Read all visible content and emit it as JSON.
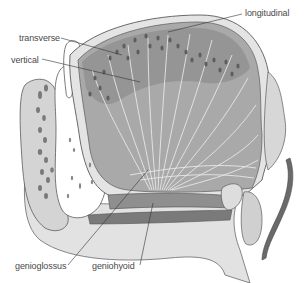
{
  "diagram": {
    "colors": {
      "muscle_dark": "#8c8c8c",
      "muscle_mid": "#a6a6a6",
      "muscle_light": "#bdbdbd",
      "soft_tissue": "#d9d9d9",
      "bone": "#ffffff",
      "outline": "#5a5a5a",
      "fiber_lines": "#eeeeee",
      "spots": "#6e6e6e",
      "label_text": "#4a4a4a",
      "leader_line": "#333333",
      "background": "#ffffff"
    },
    "labels": [
      {
        "id": "longitudinal",
        "text": "longitudinal",
        "x": 245,
        "y": 9
      },
      {
        "id": "transverse",
        "text": "transverse",
        "x": 19,
        "y": 34
      },
      {
        "id": "vertical",
        "text": "vertical",
        "x": 11,
        "y": 56
      },
      {
        "id": "genioglossus",
        "text": "genioglossus",
        "x": 15,
        "y": 262
      },
      {
        "id": "geniohyoid",
        "text": "geniohyoid",
        "x": 92,
        "y": 262
      }
    ]
  }
}
